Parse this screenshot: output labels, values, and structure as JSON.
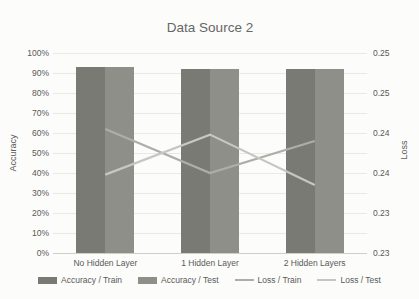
{
  "chart_data": {
    "type": "bar",
    "title": "Data Source 2",
    "categories": [
      "No Hidden Layer",
      "1 Hidden Layer",
      "2 Hidden Layers"
    ],
    "left_axis": {
      "label": "Accuracy",
      "ticks": [
        "100%",
        "90%",
        "80%",
        "70%",
        "60%",
        "50%",
        "40%",
        "30%",
        "20%",
        "10%",
        "0%"
      ],
      "min": 0,
      "max": 1
    },
    "right_axis": {
      "label": "Loss",
      "ticks": [
        "0.25",
        "0.25",
        "0.24",
        "0.24",
        "0.23",
        "0.23"
      ],
      "min": 0.225,
      "max": 0.25
    },
    "series": [
      {
        "name": "Accuracy / Train",
        "type": "bar",
        "axis": "left",
        "color": "#7a7a75",
        "values": [
          0.93,
          0.92,
          0.92
        ]
      },
      {
        "name": "Accuracy / Test",
        "type": "bar",
        "axis": "left",
        "color": "#8f8f8a",
        "values": [
          0.93,
          0.92,
          0.92
        ]
      },
      {
        "name": "Loss / Train",
        "type": "line",
        "axis": "right",
        "color": "#aeaea8",
        "values": [
          0.2405,
          0.235,
          0.239
        ]
      },
      {
        "name": "Loss / Test",
        "type": "line",
        "axis": "right",
        "color": "#c7c7c1",
        "values": [
          0.2348,
          0.2398,
          0.2335
        ]
      }
    ],
    "legend_position": "bottom",
    "grid": true
  }
}
